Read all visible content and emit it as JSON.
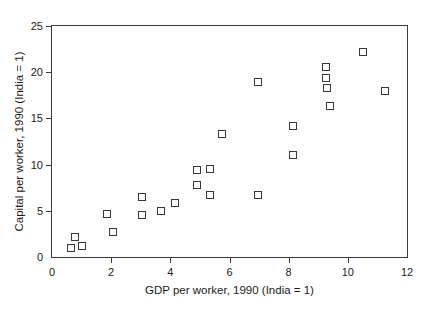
{
  "chart_data": {
    "type": "scatter",
    "title": "",
    "xlabel": "GDP per worker, 1990 (India = 1)",
    "ylabel": "Capital per worker, 1990 (India = 1)",
    "xlim": [
      0,
      12
    ],
    "ylim": [
      0,
      25
    ],
    "xticks": [
      0,
      2,
      4,
      6,
      8,
      10,
      12
    ],
    "yticks": [
      0,
      5,
      10,
      15,
      20,
      25
    ],
    "xtick_labels": [
      "0",
      "2",
      "4",
      "6",
      "8",
      "10",
      "12"
    ],
    "ytick_labels": [
      "0",
      "5",
      "10",
      "15",
      "20",
      "25"
    ],
    "grid": false,
    "legend": null,
    "marker": "open-square",
    "marker_color": "#39393c",
    "series": [
      {
        "name": "countries",
        "points": [
          {
            "x": 0.65,
            "y": 1.0
          },
          {
            "x": 0.77,
            "y": 2.2
          },
          {
            "x": 1.0,
            "y": 1.2
          },
          {
            "x": 1.85,
            "y": 4.7
          },
          {
            "x": 2.05,
            "y": 2.7
          },
          {
            "x": 3.05,
            "y": 6.5
          },
          {
            "x": 3.05,
            "y": 4.5
          },
          {
            "x": 3.7,
            "y": 5.0
          },
          {
            "x": 4.15,
            "y": 5.8
          },
          {
            "x": 4.9,
            "y": 9.4
          },
          {
            "x": 4.9,
            "y": 7.8
          },
          {
            "x": 5.35,
            "y": 9.5
          },
          {
            "x": 5.35,
            "y": 6.7
          },
          {
            "x": 5.75,
            "y": 13.3
          },
          {
            "x": 6.95,
            "y": 18.9
          },
          {
            "x": 6.95,
            "y": 6.7
          },
          {
            "x": 8.15,
            "y": 14.2
          },
          {
            "x": 8.15,
            "y": 11.0
          },
          {
            "x": 9.25,
            "y": 20.6
          },
          {
            "x": 9.25,
            "y": 19.4
          },
          {
            "x": 9.3,
            "y": 18.3
          },
          {
            "x": 9.4,
            "y": 16.3
          },
          {
            "x": 10.5,
            "y": 22.2
          },
          {
            "x": 11.25,
            "y": 18.0
          }
        ]
      }
    ]
  },
  "axes": {
    "x": {
      "title": "GDP per worker, 1990 (India = 1)",
      "tick_labels": [
        "0",
        "2",
        "4",
        "6",
        "8",
        "10",
        "12"
      ]
    },
    "y": {
      "title": "Capital per worker, 1990 (India = 1)",
      "tick_labels": [
        "0",
        "5",
        "10",
        "15",
        "20",
        "25"
      ]
    }
  }
}
